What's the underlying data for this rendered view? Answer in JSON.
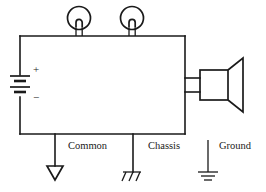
{
  "diagram": {
    "stroke_color": "#1a1a1a",
    "background_color": "#ffffff",
    "battery": {
      "name": "battery",
      "positive_sign": "+",
      "negative_sign": "−",
      "cells": 2
    },
    "lamps": [
      {
        "name": "lamp-1",
        "symbol": "indicator-lamp"
      },
      {
        "name": "lamp-2",
        "symbol": "indicator-lamp"
      }
    ],
    "speaker": {
      "name": "speaker",
      "symbol": "loudspeaker"
    },
    "grounds": [
      {
        "id": "common",
        "label": "Common",
        "symbol": "inverted-triangle",
        "connected": true
      },
      {
        "id": "chassis",
        "label": "Chassis",
        "symbol": "hatched-bar",
        "connected": true
      },
      {
        "id": "ground",
        "label": "Ground",
        "symbol": "earth-bars",
        "connected": false
      }
    ]
  }
}
